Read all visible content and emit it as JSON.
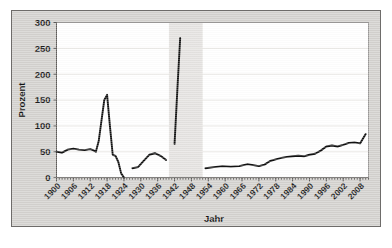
{
  "chart_data": {
    "type": "line",
    "title": "",
    "xlabel": "Jahr",
    "ylabel": "Prozent",
    "xlim": [
      1900,
      2011
    ],
    "ylim": [
      0,
      300
    ],
    "yticks": [
      0,
      50,
      100,
      150,
      200,
      250,
      300
    ],
    "xticks": [
      1900,
      1906,
      1912,
      1918,
      1924,
      1930,
      1936,
      1942,
      1948,
      1954,
      1960,
      1966,
      1972,
      1978,
      1984,
      1990,
      1996,
      2002,
      2008
    ],
    "grid": true,
    "legend": false,
    "legend_position": "none",
    "shaded_bands": [
      {
        "name": "war-gap-band",
        "x_start": 1940,
        "x_end": 1952,
        "color": "#e3e1de"
      }
    ],
    "series": [
      {
        "name": "Prozent",
        "color": "#111111",
        "segments": [
          {
            "name": "empire-weimar-segment",
            "x": [
              1900,
              1902,
              1904,
              1906,
              1908,
              1910,
              1912,
              1913,
              1914,
              1915,
              1916,
              1917,
              1918,
              1919,
              1920,
              1921,
              1922,
              1923,
              1924
            ],
            "y": [
              50,
              48,
              54,
              56,
              54,
              53,
              55,
              53,
              50,
              70,
              110,
              150,
              160,
              100,
              44,
              42,
              30,
              8,
              0
            ]
          },
          {
            "name": "weimar-late-segment",
            "x": [
              1927,
              1929,
              1931,
              1933,
              1935,
              1937,
              1939
            ],
            "y": [
              18,
              20,
              32,
              44,
              47,
              42,
              34
            ]
          },
          {
            "name": "wwii-segment",
            "x": [
              1942,
              1943,
              1944
            ],
            "y": [
              65,
              170,
              270
            ]
          },
          {
            "name": "federal-republic-segment",
            "x": [
              1953,
              1956,
              1959,
              1962,
              1965,
              1968,
              1970,
              1972,
              1974,
              1976,
              1978,
              1980,
              1982,
              1984,
              1986,
              1988,
              1990,
              1992,
              1994,
              1996,
              1998,
              2000,
              2002,
              2004,
              2006,
              2008,
              2010
            ],
            "y": [
              18,
              20,
              22,
              21,
              22,
              26,
              24,
              22,
              25,
              32,
              35,
              38,
              40,
              41,
              42,
              41,
              44,
              46,
              52,
              60,
              62,
              60,
              63,
              67,
              68,
              66,
              84
            ]
          }
        ]
      }
    ]
  }
}
